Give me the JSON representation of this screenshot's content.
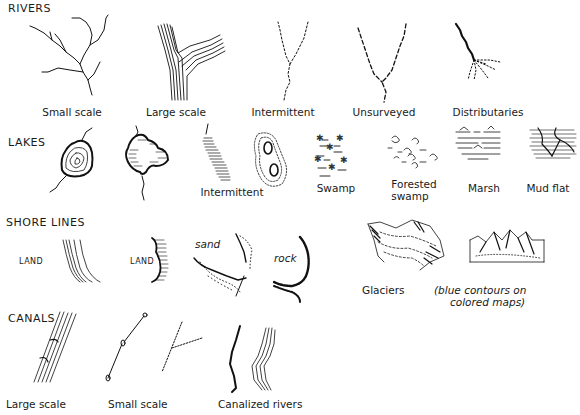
{
  "sections": {
    "rivers": {
      "heading": "RIVERS",
      "items": [
        {
          "label": "Small scale"
        },
        {
          "label": "Large scale"
        },
        {
          "label": "Intermittent"
        },
        {
          "label": "Unsurveyed"
        },
        {
          "label": "Distributaries"
        }
      ]
    },
    "lakes": {
      "heading": "LAKES",
      "items": [
        {
          "label": ""
        },
        {
          "label": ""
        },
        {
          "label": "Intermittent"
        },
        {
          "label": "Swamp"
        },
        {
          "label": "Forested swamp"
        },
        {
          "label": "Marsh"
        },
        {
          "label": "Mud flat"
        }
      ],
      "forested_line1": "Forested",
      "forested_line2": "swamp"
    },
    "shore_lines": {
      "heading": "SHORE LINES",
      "land_label_1": "LAND",
      "land_label_2": "LAND",
      "sand_label": "sand",
      "rock_label": "rock",
      "glaciers_label": "Glaciers",
      "note_line1": "(blue contours on",
      "note_line2": "colored maps)"
    },
    "canals": {
      "heading": "CANALS",
      "items": [
        {
          "label": "Large scale"
        },
        {
          "label": "Small scale"
        },
        {
          "label": "Canalized rivers"
        }
      ]
    }
  }
}
